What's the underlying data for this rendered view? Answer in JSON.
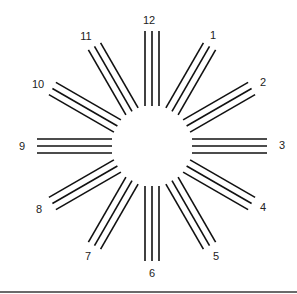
{
  "diagram": {
    "type": "astigmatism-clock-dial",
    "center": [
      152,
      146
    ],
    "inner_radius": 40,
    "outer_radius": 115,
    "lines_per_spoke": 3,
    "line_spacing": 7,
    "line_color": "#111111",
    "label_color": "#222222",
    "border_color": "#6a6a6a",
    "spokes": [
      {
        "label": "12",
        "hour": 12,
        "label_pos": [
          149,
          24
        ]
      },
      {
        "label": "1",
        "hour": 1,
        "label_pos": [
          213,
          39
        ]
      },
      {
        "label": "2",
        "hour": 2,
        "label_pos": [
          263,
          86
        ]
      },
      {
        "label": "3",
        "hour": 3,
        "label_pos": [
          282,
          149
        ]
      },
      {
        "label": "4",
        "hour": 4,
        "label_pos": [
          263,
          211
        ]
      },
      {
        "label": "5",
        "hour": 5,
        "label_pos": [
          216,
          260
        ]
      },
      {
        "label": "6",
        "hour": 6,
        "label_pos": [
          152,
          277
        ]
      },
      {
        "label": "7",
        "hour": 7,
        "label_pos": [
          88,
          260
        ]
      },
      {
        "label": "8",
        "hour": 8,
        "label_pos": [
          39,
          213
        ]
      },
      {
        "label": "9",
        "hour": 9,
        "label_pos": [
          22,
          150
        ]
      },
      {
        "label": "10",
        "hour": 10,
        "label_pos": [
          38,
          88
        ]
      },
      {
        "label": "11",
        "hour": 11,
        "label_pos": [
          86,
          40
        ]
      }
    ]
  }
}
